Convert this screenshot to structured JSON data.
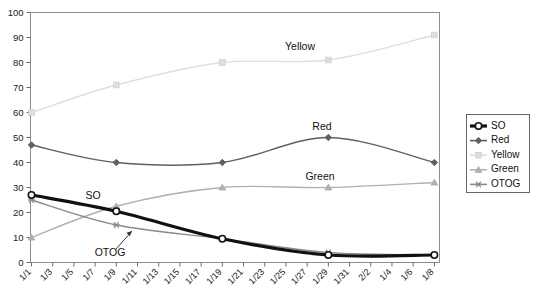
{
  "chart_data": {
    "type": "line",
    "title": "",
    "xlabel": "",
    "ylabel": "",
    "ylim": [
      0,
      100
    ],
    "ytick_step": 10,
    "yticks": [
      "0",
      "10",
      "20",
      "30",
      "40",
      "50",
      "60",
      "70",
      "80",
      "90",
      "100"
    ],
    "grid": false,
    "legend_position": "right",
    "categories": [
      "1/1",
      "1/3",
      "1/5",
      "1/7",
      "1/9",
      "1/11",
      "1/13",
      "1/15",
      "1/17",
      "1/19",
      "1/21",
      "1/23",
      "1/25",
      "1/27",
      "1/29",
      "1/31",
      "2/2",
      "1/4",
      "1/6",
      "1/8"
    ],
    "marked_categories": [
      "1/1",
      "1/9",
      "1/19",
      "1/29",
      "1/8"
    ],
    "series": [
      {
        "name": "SO",
        "color": "#111111",
        "marker": "circle",
        "width": 3.2,
        "x": [
          "1/1",
          "1/9",
          "1/19",
          "1/29",
          "1/8"
        ],
        "values": [
          27,
          20.5,
          9.5,
          3,
          3
        ]
      },
      {
        "name": "Red",
        "color": "#5f5f5f",
        "marker": "diamond",
        "width": 1.4,
        "x": [
          "1/1",
          "1/9",
          "1/19",
          "1/29",
          "1/8"
        ],
        "values": [
          47,
          40,
          40,
          50,
          40
        ]
      },
      {
        "name": "Yellow",
        "color": "#dedede",
        "marker": "square",
        "width": 1.4,
        "x": [
          "1/1",
          "1/9",
          "1/19",
          "1/29",
          "1/8"
        ],
        "values": [
          60,
          71,
          80,
          81,
          91
        ]
      },
      {
        "name": "Green",
        "color": "#b0b0b0",
        "marker": "triangle",
        "width": 1.4,
        "x": [
          "1/1",
          "1/9",
          "1/19",
          "1/29",
          "1/8"
        ],
        "values": [
          10,
          22.5,
          30,
          30,
          32
        ]
      },
      {
        "name": "OTOG",
        "color": "#8a8a8a",
        "marker": "asterisk",
        "width": 1.4,
        "x": [
          "1/1",
          "1/9",
          "1/19",
          "1/29",
          "1/8"
        ],
        "values": [
          25,
          15,
          9.5,
          4,
          3
        ]
      }
    ],
    "annotations": [
      {
        "text": "Yellow",
        "x": 300,
        "y": 50
      },
      {
        "text": "Red",
        "x": 322,
        "y": 130
      },
      {
        "text": "Green",
        "x": 320,
        "y": 180
      },
      {
        "text": "SO",
        "x": 93,
        "y": 199
      },
      {
        "text": "OTOG",
        "x": 110,
        "y": 256
      }
    ]
  },
  "legend": {
    "items": [
      {
        "label": "SO"
      },
      {
        "label": "Red"
      },
      {
        "label": "Yellow"
      },
      {
        "label": "Green"
      },
      {
        "label": "OTOG"
      }
    ]
  }
}
